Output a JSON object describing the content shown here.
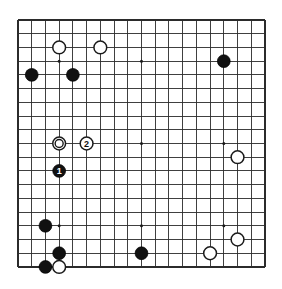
{
  "diagram": {
    "kind": "go-board-diagram",
    "board_size": 19,
    "colors": {
      "background": "#ffffff",
      "grid_line": "#2b2b2b",
      "board_edge": "#1a1a1a",
      "black_stone": "#111111",
      "white_stone": "#ffffff",
      "star_point": "#1a1a1a"
    },
    "geometry": {
      "left": 18,
      "top": 20,
      "spacing": 13.72,
      "stone_radius": 6.4,
      "star_radius": 1.5
    },
    "star_points": [
      {
        "col": 3,
        "row": 3
      },
      {
        "col": 9,
        "row": 3
      },
      {
        "col": 15,
        "row": 3
      },
      {
        "col": 3,
        "row": 9
      },
      {
        "col": 9,
        "row": 9
      },
      {
        "col": 15,
        "row": 9
      },
      {
        "col": 3,
        "row": 15
      },
      {
        "col": 9,
        "row": 15
      },
      {
        "col": 15,
        "row": 15
      }
    ],
    "stones": [
      {
        "id": "w-d17",
        "color": "white",
        "col": 3,
        "row": 2,
        "label": "",
        "mark": ""
      },
      {
        "id": "w-g17",
        "color": "white",
        "col": 6,
        "row": 2,
        "label": "",
        "mark": ""
      },
      {
        "id": "b-b15",
        "color": "black",
        "col": 1,
        "row": 4,
        "label": "",
        "mark": ""
      },
      {
        "id": "b-e15",
        "color": "black",
        "col": 4,
        "row": 4,
        "label": "",
        "mark": ""
      },
      {
        "id": "b-q16",
        "color": "black",
        "col": 15,
        "row": 3,
        "label": "",
        "mark": ""
      },
      {
        "id": "w-d10-marked",
        "color": "white",
        "col": 3,
        "row": 9,
        "label": "",
        "mark": "circle"
      },
      {
        "id": "w-move-2",
        "color": "white",
        "col": 5,
        "row": 9,
        "label": "2",
        "mark": ""
      },
      {
        "id": "w-r9",
        "color": "white",
        "col": 16,
        "row": 10,
        "label": "",
        "mark": ""
      },
      {
        "id": "b-move-1",
        "color": "black",
        "col": 3,
        "row": 11,
        "label": "1",
        "mark": ""
      },
      {
        "id": "b-c5",
        "color": "black",
        "col": 2,
        "row": 15,
        "label": "",
        "mark": ""
      },
      {
        "id": "b-d3",
        "color": "black",
        "col": 3,
        "row": 17,
        "label": "",
        "mark": ""
      },
      {
        "id": "b-c2",
        "color": "black",
        "col": 2,
        "row": 18,
        "label": "",
        "mark": ""
      },
      {
        "id": "w-d2",
        "color": "white",
        "col": 3,
        "row": 18,
        "label": "",
        "mark": ""
      },
      {
        "id": "b-k3",
        "color": "black",
        "col": 9,
        "row": 17,
        "label": "",
        "mark": ""
      },
      {
        "id": "w-q3",
        "color": "white",
        "col": 14,
        "row": 17,
        "label": "",
        "mark": ""
      },
      {
        "id": "w-r4",
        "color": "white",
        "col": 16,
        "row": 16,
        "label": "",
        "mark": ""
      }
    ],
    "move_sequence": [
      {
        "number": "1",
        "color": "black"
      },
      {
        "number": "2",
        "color": "white"
      }
    ]
  }
}
